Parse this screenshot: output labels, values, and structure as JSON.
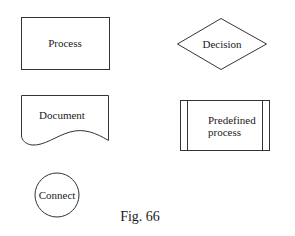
{
  "diagram": {
    "type": "flowchart-symbol-legend",
    "shapes": [
      {
        "id": "process",
        "shape": "rectangle",
        "label": "Process"
      },
      {
        "id": "decision",
        "shape": "diamond",
        "label": "Decision"
      },
      {
        "id": "document",
        "shape": "document",
        "label": "Document"
      },
      {
        "id": "predefined",
        "shape": "predefined-process",
        "label_line1": "Predefined",
        "label_line2": "process"
      },
      {
        "id": "connect",
        "shape": "circle",
        "label": "Connect"
      }
    ],
    "caption": "Fig. 66",
    "colors": {
      "stroke": "#333333",
      "background": "#ffffff",
      "text": "#1a1a1a"
    }
  }
}
